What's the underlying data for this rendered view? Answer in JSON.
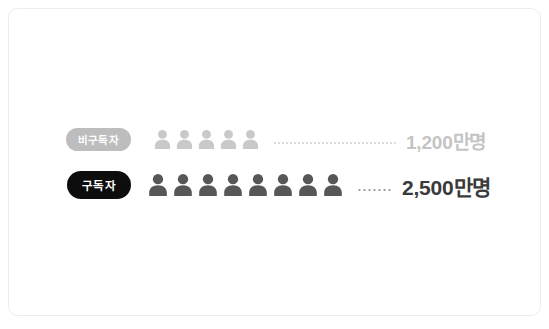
{
  "card": {
    "background": "#ffffff",
    "border_color": "#ececec"
  },
  "chart_data": {
    "type": "bar",
    "chart_subtype": "pictogram",
    "title": "",
    "xlabel": "",
    "ylabel": "",
    "categories": [
      "비구독자",
      "구독자"
    ],
    "values": [
      12000000,
      25000000
    ],
    "value_labels": [
      "1,200만명",
      "2,500만명"
    ],
    "icon_counts": [
      5,
      8
    ],
    "icon_unit": "person-icon",
    "series": [
      {
        "name": "비구독자",
        "value": 12000000,
        "value_label": "1,200만명",
        "icon_count": 5,
        "icon_color": "#c9c9c9",
        "pill_color": "#bdbdbd",
        "text_color": "#c4c4c4"
      },
      {
        "name": "구독자",
        "value": 25000000,
        "value_label": "2,500만명",
        "icon_count": 8,
        "icon_color": "#575757",
        "pill_color": "#0d0d0d",
        "text_color": "#3a3a3a"
      }
    ],
    "grid": false,
    "legend": "none"
  },
  "rows": {
    "non_subscriber": {
      "pill_label": "비구독자",
      "value_label": "1,200만명",
      "icon_count": 5,
      "icon_name": "person-icon",
      "pill_color": "#bdbdbd",
      "icon_color": "#c9c9c9",
      "value_color": "#c4c4c4",
      "dot_color": "#dcdcdc"
    },
    "subscriber": {
      "pill_label": "구독자",
      "value_label": "2,500만명",
      "icon_count": 8,
      "icon_name": "person-icon",
      "pill_color": "#0d0d0d",
      "icon_color": "#575757",
      "value_color": "#3a3a3a",
      "dot_color": "#9a9a9a"
    }
  }
}
